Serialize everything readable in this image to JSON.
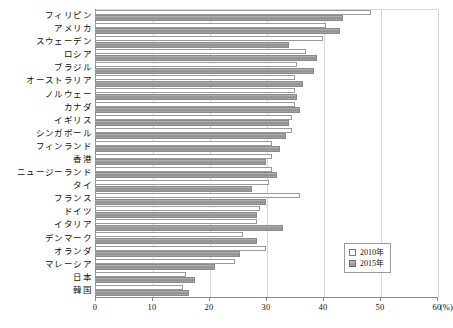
{
  "chart_data": {
    "type": "bar",
    "orientation": "horizontal",
    "title": "",
    "xlabel": "(%)",
    "ylabel": "",
    "xlim": [
      0,
      60
    ],
    "xticks": [
      0,
      10,
      20,
      30,
      40,
      50,
      60
    ],
    "xtick_labels": [
      "0",
      "10",
      "20",
      "30",
      "40",
      "50",
      "60"
    ],
    "unit_label": "(%)",
    "grid": true,
    "legend_position": "lower-right",
    "categories": [
      "フィリピン",
      "アメリカ",
      "スウェーデン",
      "ロシア",
      "ブラジル",
      "オーストラリア",
      "ノルウェー",
      "カナダ",
      "イギリス",
      "シンガポール",
      "フィンランド",
      "香港",
      "ニュージーランド",
      "タイ",
      "フランス",
      "ドイツ",
      "イタリア",
      "デンマーク",
      "オランダ",
      "マレーシア",
      "日本",
      "韓国"
    ],
    "series": [
      {
        "name": "2010年",
        "color": "#ffffff",
        "values": [
          48.5,
          40.5,
          40.0,
          37.0,
          35.5,
          35.0,
          35.0,
          35.0,
          34.5,
          34.5,
          31.0,
          31.0,
          31.0,
          30.5,
          36.0,
          29.0,
          28.5,
          26.0,
          30.0,
          24.5,
          16.0,
          15.5
        ]
      },
      {
        "name": "2015年",
        "color": "#9b9b9b",
        "values": [
          43.5,
          43.0,
          34.0,
          39.0,
          38.5,
          36.5,
          35.5,
          36.0,
          34.0,
          33.5,
          32.5,
          30.0,
          32.0,
          27.5,
          30.0,
          28.5,
          33.0,
          28.5,
          25.5,
          21.0,
          17.5,
          16.5
        ]
      }
    ]
  },
  "legend": {
    "items": [
      {
        "label": "2010年",
        "swatch": "white-square"
      },
      {
        "label": "2015年",
        "swatch": "gray-square"
      }
    ]
  }
}
